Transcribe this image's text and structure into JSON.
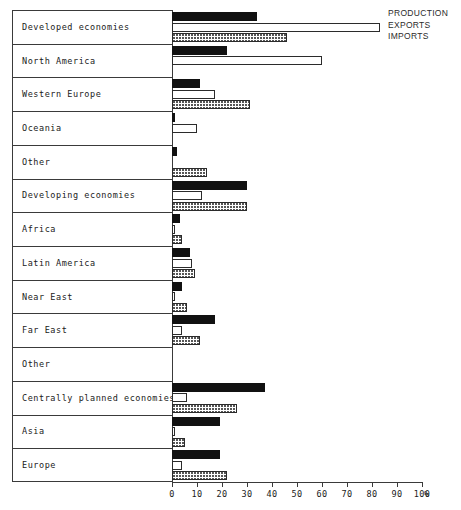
{
  "chart_data": {
    "type": "bar",
    "orientation": "horizontal",
    "title": "",
    "xlabel": "%",
    "ylabel": "",
    "xlim": [
      0,
      100
    ],
    "xticks": [
      0,
      10,
      20,
      30,
      40,
      50,
      60,
      70,
      80,
      90,
      100
    ],
    "xtick_labels": [
      "0",
      "10",
      "20",
      "30",
      "40",
      "50",
      "60",
      "70",
      "80",
      "90",
      "100"
    ],
    "x_unit_suffix": "%",
    "grid": false,
    "legend_position": "top-right",
    "legend": [
      "PRODUCTION",
      "EXPORTS",
      "IMPORTS"
    ],
    "categories": [
      "Developed economies",
      "North America",
      "Western Europe",
      "Oceania",
      "Other",
      "Developing economies",
      "Africa",
      "Latin America",
      "Near East",
      "Far East",
      "Other",
      "Centrally planned economies",
      "Asia",
      "Europe"
    ],
    "series": [
      {
        "name": "PRODUCTION",
        "style": "solid-black",
        "values": [
          34,
          22,
          11,
          1,
          2,
          30,
          3,
          7,
          4,
          17,
          0,
          37,
          19,
          19
        ]
      },
      {
        "name": "EXPORTS",
        "style": "white-outline",
        "values": [
          83,
          60,
          17,
          10,
          0,
          12,
          1,
          8,
          1,
          4,
          0,
          6,
          1,
          4
        ]
      },
      {
        "name": "IMPORTS",
        "style": "dotted-fill",
        "values": [
          46,
          0,
          31,
          0,
          14,
          30,
          4,
          9,
          6,
          11,
          0,
          26,
          5,
          22
        ]
      }
    ]
  }
}
